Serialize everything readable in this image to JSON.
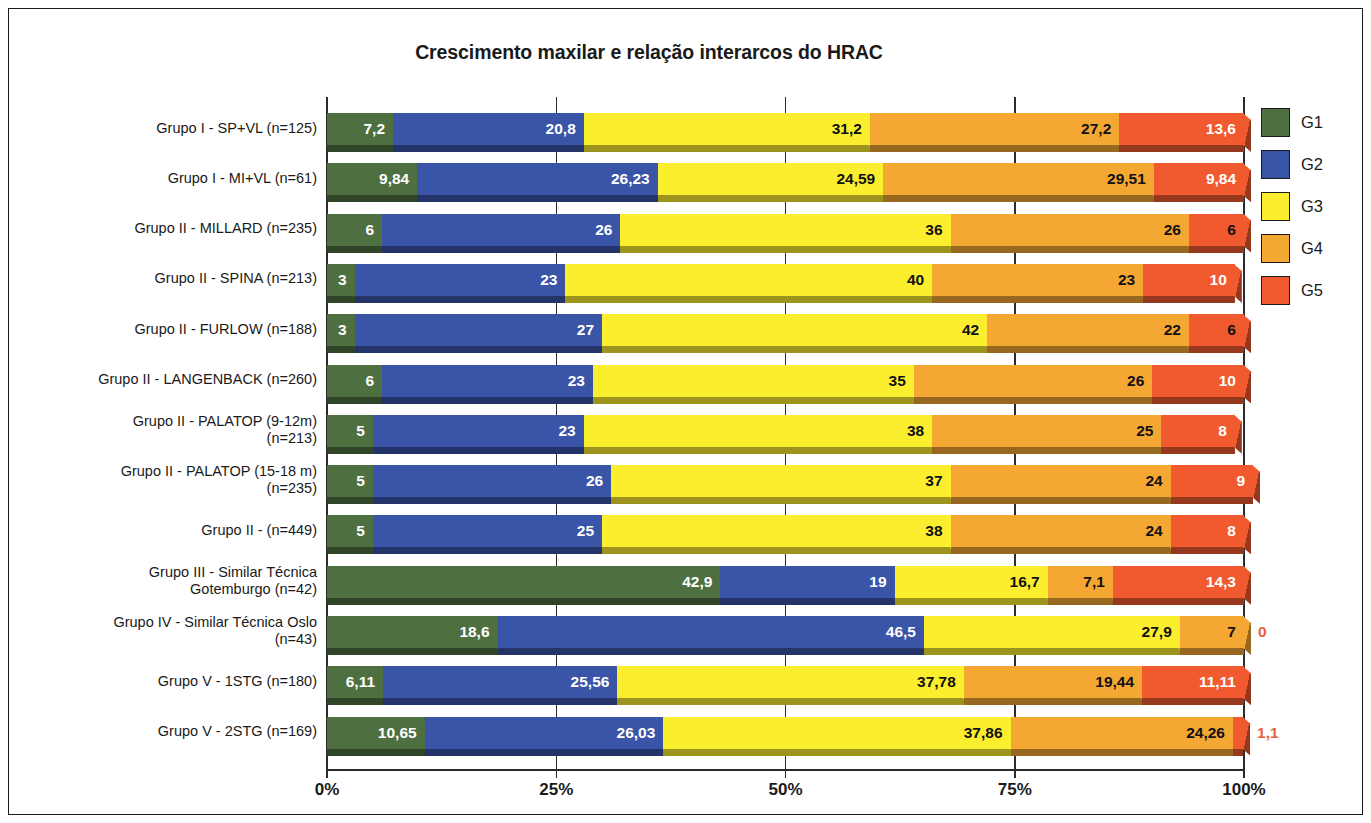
{
  "chart_data": {
    "type": "bar",
    "orientation": "horizontal",
    "stacked": true,
    "stack_mode": "percent",
    "title": "Crescimento maxilar e relação interarcos do HRAC",
    "xlabel": "",
    "ylabel": "",
    "xlim": [
      0,
      100
    ],
    "xtick_labels": [
      "0%",
      "25%",
      "50%",
      "75%",
      "100%"
    ],
    "xtick_values": [
      0,
      25,
      50,
      75,
      100
    ],
    "grid": false,
    "legend_position": "right",
    "categories": [
      "Grupo I - SP+VL (n=125)",
      "Grupo I - MI+VL (n=61)",
      "Grupo II - MILLARD (n=235)",
      "Grupo II - SPINA (n=213)",
      "Grupo II - FURLOW (n=188)",
      "Grupo II - LANGENBACK (n=260)",
      "Grupo II - PALATOP (9-12m)\n(n=213)",
      "Grupo II - PALATOP (15-18 m)\n(n=235)",
      "Grupo II - (n=449)",
      "Grupo III - Similar Técnica\nGotemburgo (n=42)",
      "Grupo IV - Similar Técnica Oslo\n(n=43)",
      "Grupo V - 1STG (n=180)",
      "Grupo V - 2STG (n=169)"
    ],
    "series": [
      {
        "name": "G1",
        "color": "#4e7040",
        "values": [
          7.2,
          9.84,
          6,
          3,
          3,
          6,
          5,
          5,
          5,
          42.9,
          18.6,
          6.11,
          10.65
        ],
        "labels": [
          "7,2",
          "9,84",
          "6",
          "3",
          "3",
          "6",
          "5",
          "5",
          "5",
          "42,9",
          "18,6",
          "6,11",
          "10,65"
        ]
      },
      {
        "name": "G2",
        "color": "#3a54a8",
        "values": [
          20.8,
          26.23,
          26,
          23,
          27,
          23,
          23,
          26,
          25,
          19,
          46.5,
          25.56,
          26.03
        ],
        "labels": [
          "20,8",
          "26,23",
          "26",
          "23",
          "27",
          "23",
          "23",
          "26",
          "25",
          "19",
          "46,5",
          "25,56",
          "26,03"
        ]
      },
      {
        "name": "G3",
        "color": "#fbee2e",
        "values": [
          31.2,
          24.59,
          36,
          40,
          42,
          35,
          38,
          37,
          38,
          16.7,
          27.9,
          37.78,
          37.86
        ],
        "labels": [
          "31,2",
          "24,59",
          "36",
          "40",
          "42",
          "35",
          "38",
          "37",
          "38",
          "16,7",
          "27,9",
          "37,78",
          "37,86"
        ]
      },
      {
        "name": "G4",
        "color": "#f5a734",
        "values": [
          27.2,
          29.51,
          26,
          23,
          22,
          26,
          25,
          24,
          24,
          7.1,
          7,
          19.44,
          24.26
        ],
        "labels": [
          "27,2",
          "29,51",
          "26",
          "23",
          "22",
          "26",
          "25",
          "24",
          "24",
          "7,1",
          "7",
          "19,44",
          "24,26"
        ]
      },
      {
        "name": "G5",
        "color": "#f15a2e",
        "values": [
          13.6,
          9.84,
          6,
          10,
          6,
          10,
          8,
          9,
          8,
          14.3,
          0,
          11.11,
          1.1
        ],
        "labels": [
          "13,6",
          "9,84",
          "6",
          "10",
          "6",
          "10",
          "8",
          "9",
          "8",
          "14,3",
          "0",
          "11,11",
          "1,1"
        ]
      }
    ]
  },
  "legend": {
    "items": [
      {
        "label": "G1",
        "color": "#4e7040"
      },
      {
        "label": "G2",
        "color": "#3a54a8"
      },
      {
        "label": "G3",
        "color": "#fbee2e"
      },
      {
        "label": "G4",
        "color": "#f5a734"
      },
      {
        "label": "G5",
        "color": "#f15a2e"
      }
    ]
  },
  "colors": {
    "g1": "#4e7040",
    "g2": "#3a54a8",
    "g3": "#fbee2e",
    "g4": "#f5a734",
    "g5": "#f15a2e",
    "outside_label": "#e8613c",
    "frame": "#1a1a1a",
    "axis": "#2b2b2b"
  }
}
